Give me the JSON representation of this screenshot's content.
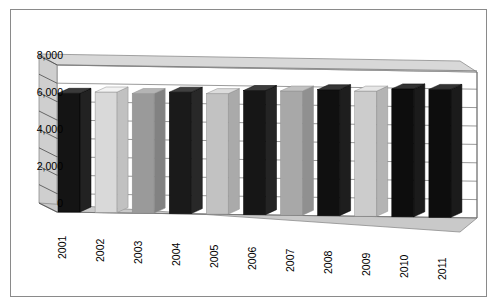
{
  "chart_data": {
    "type": "bar",
    "title": "",
    "subtitle": "",
    "xlabel": "",
    "ylabel": "",
    "categories": [
      "2001",
      "2002",
      "2003",
      "2004",
      "2005",
      "2006",
      "2007",
      "2008",
      "2009",
      "2010",
      "2011"
    ],
    "values": [
      6450,
      6550,
      6500,
      6600,
      6550,
      6750,
      6750,
      6850,
      6800,
      6950,
      6950
    ],
    "series": [
      {
        "name": "",
        "values": [
          6450,
          6550,
          6500,
          6600,
          6550,
          6750,
          6750,
          6850,
          6800,
          6950,
          6950
        ]
      }
    ],
    "bar_colors": [
      "#141414",
      "#d9d9d9",
      "#9a9a9a",
      "#1a1a1a",
      "#c2c2c2",
      "#161616",
      "#a8a8a8",
      "#101010",
      "#cccccc",
      "#0d0d0d",
      "#0d0d0d"
    ],
    "ylim": [
      0,
      8800
    ],
    "yticks": [
      0,
      2000,
      4000,
      6000,
      8000
    ],
    "ytick_labels": [
      "0",
      "2,000",
      "4,000",
      "6,000",
      "8,000"
    ],
    "minor_gridline_step": 1000,
    "grid": true,
    "grid_color": "#6e6e6e",
    "legend": "none",
    "style": "3d-column",
    "plot_background": "#ffffff",
    "wall_color": "#ffffff",
    "side_wall_color": "#cfcfcf",
    "floor_color": "#c9c9c9",
    "frame_color": "#8a8a8a"
  },
  "axis": {
    "y_ticks": [
      {
        "label": "8,000",
        "value": 8000
      },
      {
        "label": "6,000",
        "value": 6000
      },
      {
        "label": "4,000",
        "value": 4000
      },
      {
        "label": "2,000",
        "value": 2000
      },
      {
        "label": "0",
        "value": 0
      }
    ],
    "x_ticks": [
      {
        "label": "2001"
      },
      {
        "label": "2002"
      },
      {
        "label": "2003"
      },
      {
        "label": "2004"
      },
      {
        "label": "2005"
      },
      {
        "label": "2006"
      },
      {
        "label": "2007"
      },
      {
        "label": "2008"
      },
      {
        "label": "2009"
      },
      {
        "label": "2010"
      },
      {
        "label": "2011"
      }
    ]
  }
}
